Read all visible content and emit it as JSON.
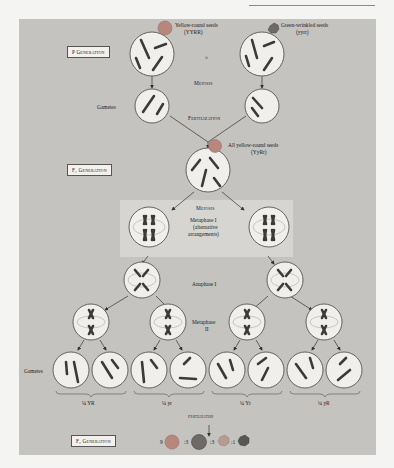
{
  "figure": {
    "header_rule": true,
    "p_generation": {
      "label": "P Generation",
      "parent_left": {
        "caption": "Yellow-round seeds",
        "genotype": "(YYRR)",
        "seed_color": "#b8867a"
      },
      "parent_right": {
        "caption": "Green-wrinkled seeds",
        "genotype": "(yyrr)",
        "seed_color": "#6e6a66"
      },
      "cross_symbol": "×",
      "meiosis_label": "Meiosis",
      "gametes_label": "Gametes",
      "gamete_left_alleles": [
        "R",
        "Y"
      ],
      "gamete_right_alleles": [
        "r",
        "y"
      ],
      "fertilization_label": "Fertilization"
    },
    "f1_generation": {
      "label": "F₁ Generation",
      "caption": "All yellow-round seeds",
      "genotype": "(YyRr)",
      "seed_color": "#b8867a",
      "alleles": [
        "R",
        "y",
        "r",
        "Y"
      ]
    },
    "meiosis_stage": {
      "title": "Meiosis",
      "metaphase1_label": "Metaphase I",
      "metaphase1_note_1": "(alternative",
      "metaphase1_note_2": "arrangements)",
      "left_cell_alleles": [
        "Y",
        "y",
        "R",
        "r"
      ],
      "right_cell_alleles": [
        "Y",
        "y",
        "r",
        "R"
      ],
      "anaphase1_label": "Anaphase I",
      "metaphase2_label": "Metaphase",
      "metaphase2_numeral": "II"
    },
    "gametes_row": {
      "label": "Gametes",
      "groups": [
        {
          "fraction": "¼ YR"
        },
        {
          "fraction": "¼ yr"
        },
        {
          "fraction": "¼ Yr"
        },
        {
          "fraction": "¼ yR"
        }
      ]
    },
    "f2_generation": {
      "fertilization_label": "Fertilization",
      "label": "F₂ Generation",
      "ratio": [
        {
          "count": "9",
          "phenotype": "yellow-round",
          "color": "#b8867a"
        },
        {
          "count": ":3",
          "phenotype": "green-round",
          "color": "#6f6a68"
        },
        {
          "count": ":3",
          "phenotype": "yellow-wrinkled",
          "color": "#b89a90"
        },
        {
          "count": ":1",
          "phenotype": "green-wrinkled",
          "color": "#5a5654"
        }
      ]
    },
    "colors": {
      "panel": "#c4c3bf",
      "cell_fill": "#f0efec",
      "cell_stroke": "#555555",
      "chromosome": "#3a3a3a",
      "highlight": "#d6d5d1"
    }
  }
}
